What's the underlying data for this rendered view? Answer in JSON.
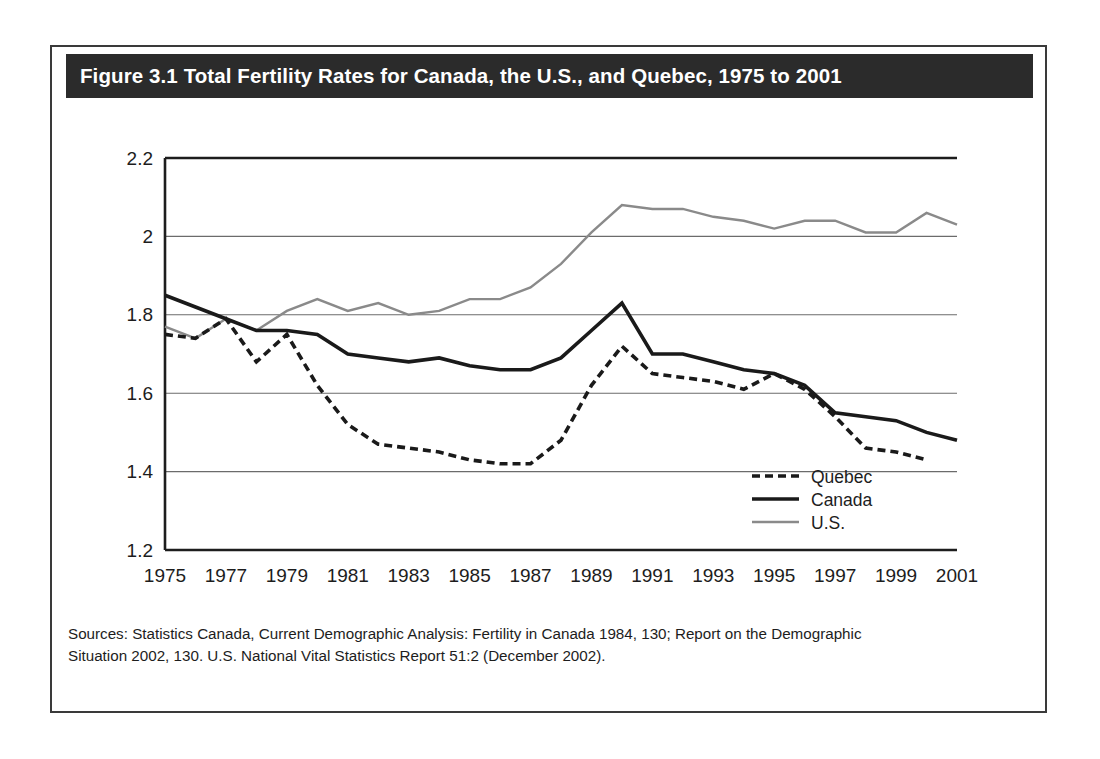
{
  "figure": {
    "title": "Figure 3.1 Total Fertility Rates for Canada, the U.S., and Quebec, 1975 to 2001",
    "sources_line1": "Sources: Statistics Canada, Current Demographic Analysis: Fertility in Canada 1984, 130; Report on the Demographic",
    "sources_line2": "Situation 2002, 130. U.S. National Vital Statistics Report 51:2 (December 2002)."
  },
  "colors": {
    "title_bar": "#2b2b2b",
    "title_text": "#ffffff",
    "frame": "#3a3a3a",
    "axis": "#1d1d1d",
    "gridline": "#6b6b6b",
    "quebec": "#1a1a1a",
    "canada": "#1a1a1a",
    "us": "#8a8a8a"
  },
  "chart_data": {
    "type": "line",
    "title": "Figure 3.1 Total Fertility Rates for Canada, the U.S., and Quebec, 1975 to 2001",
    "xlabel": "",
    "ylabel": "",
    "xlim": [
      1975,
      2001
    ],
    "ylim": [
      1.2,
      2.2
    ],
    "yticks": [
      "1.2",
      "1.4",
      "1.6",
      "1.8",
      "2",
      "2.2"
    ],
    "ytick_values": [
      1.2,
      1.4,
      1.6,
      1.8,
      2.0,
      2.2
    ],
    "xticks": [
      "1975",
      "1977",
      "1979",
      "1981",
      "1983",
      "1985",
      "1987",
      "1989",
      "1991",
      "1993",
      "1995",
      "1997",
      "1999",
      "2001"
    ],
    "xtick_values": [
      1975,
      1977,
      1979,
      1981,
      1983,
      1985,
      1987,
      1989,
      1991,
      1993,
      1995,
      1997,
      1999,
      2001
    ],
    "grid": true,
    "legend_position": "bottom-right",
    "x": [
      1975,
      1976,
      1977,
      1978,
      1979,
      1980,
      1981,
      1982,
      1983,
      1984,
      1985,
      1986,
      1987,
      1988,
      1989,
      1990,
      1991,
      1992,
      1993,
      1994,
      1995,
      1996,
      1997,
      1998,
      1999,
      2000,
      2001
    ],
    "series": [
      {
        "name": "Quebec",
        "style": "dashed",
        "color": "#1a1a1a",
        "values": [
          1.75,
          1.74,
          1.79,
          1.68,
          1.75,
          1.62,
          1.52,
          1.47,
          1.46,
          1.45,
          1.43,
          1.42,
          1.42,
          1.48,
          1.62,
          1.72,
          1.65,
          1.64,
          1.63,
          1.61,
          1.65,
          1.61,
          1.54,
          1.46,
          1.45,
          1.43,
          null
        ]
      },
      {
        "name": "Canada",
        "style": "solid-thick",
        "color": "#1a1a1a",
        "values": [
          1.85,
          1.82,
          1.79,
          1.76,
          1.76,
          1.75,
          1.7,
          1.69,
          1.68,
          1.69,
          1.67,
          1.66,
          1.66,
          1.69,
          1.76,
          1.83,
          1.7,
          1.7,
          1.68,
          1.66,
          1.65,
          1.62,
          1.55,
          1.54,
          1.53,
          1.5,
          1.48
        ]
      },
      {
        "name": "U.S.",
        "style": "solid-gray",
        "color": "#8a8a8a",
        "values": [
          1.77,
          1.74,
          1.79,
          1.76,
          1.81,
          1.84,
          1.81,
          1.83,
          1.8,
          1.81,
          1.84,
          1.84,
          1.87,
          1.93,
          2.01,
          2.08,
          2.07,
          2.07,
          2.05,
          2.04,
          2.02,
          2.04,
          2.04,
          2.01,
          2.01,
          2.06,
          2.03
        ]
      }
    ]
  },
  "legend": {
    "items": [
      {
        "label": "Quebec",
        "style": "dashed"
      },
      {
        "label": "Canada",
        "style": "solid-thick"
      },
      {
        "label": "U.S.",
        "style": "solid-gray"
      }
    ]
  }
}
